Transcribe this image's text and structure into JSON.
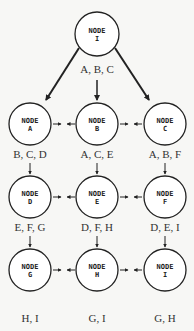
{
  "diagram": {
    "top": {
      "line1": "NODE",
      "line2": "I",
      "label": "A, B, C"
    },
    "nodes": [
      {
        "line1": "NODE",
        "line2": "A",
        "label": "B, C, D"
      },
      {
        "line1": "NODE",
        "line2": "B",
        "label": "A, C, E"
      },
      {
        "line1": "NODE",
        "line2": "C",
        "label": "A, B, F"
      },
      {
        "line1": "NODE",
        "line2": "D",
        "label": "E, F, G"
      },
      {
        "line1": "NODE",
        "line2": "E",
        "label": "D, F, H"
      },
      {
        "line1": "NODE",
        "line2": "F",
        "label": "D, E, I"
      },
      {
        "line1": "NODE",
        "line2": "G",
        "label": "H, I"
      },
      {
        "line1": "NODE",
        "line2": "H",
        "label": "G, I"
      },
      {
        "line1": "NODE",
        "line2": "I",
        "label": "G, H"
      }
    ],
    "colors": {
      "stroke": "#222222",
      "fill": "#ffffff",
      "background": "#f7f7f5"
    }
  }
}
